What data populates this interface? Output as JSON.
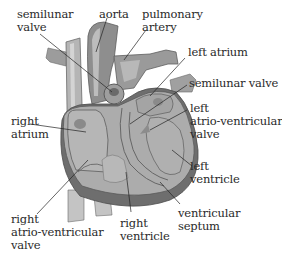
{
  "diagram": {
    "colors": {
      "heart_fill": "#a9a9a9",
      "heart_dark": "#6e6e6e",
      "wall_edge": "#5a5a5a",
      "vessel_fill": "#9a9a9a",
      "vessel_light": "#c8c8c8",
      "text": "#2a2a2a",
      "leader_line": "#222222"
    },
    "labels": {
      "semilunar_valve_left": [
        "semilunar",
        "valve"
      ],
      "aorta": "aorta",
      "pulmonary_artery": [
        "pulmonary",
        "artery"
      ],
      "left_atrium": "left atrium",
      "semilunar_valve_right": "semilunar valve",
      "left_av_valve": [
        "left",
        "atrio-ventricular",
        "valve"
      ],
      "right_atrium": [
        "right",
        "atrium"
      ],
      "left_ventricle": [
        "left",
        "ventricle"
      ],
      "right_av_valve": [
        "right",
        "atrio-ventricular",
        "valve"
      ],
      "right_ventricle": [
        "right",
        "ventricle"
      ],
      "ventricular_septum": [
        "ventricular",
        "septum"
      ]
    }
  }
}
